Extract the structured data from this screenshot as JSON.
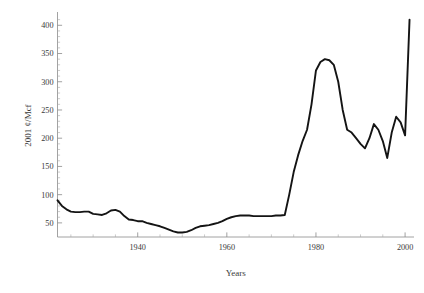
{
  "chart_data": {
    "type": "line",
    "title": "",
    "xlabel": "Years",
    "ylabel": "2001 ¢/Mcf",
    "xlim": [
      1922,
      2002
    ],
    "ylim": [
      25,
      420
    ],
    "grid": false,
    "legend": "none",
    "x_ticks_major": [
      1940,
      1960,
      1980,
      2000
    ],
    "x_tick_labels": [
      "1940",
      "1960",
      "1980",
      "2000"
    ],
    "x_ticks_minor": [
      1925,
      1930,
      1935,
      1945,
      1950,
      1955,
      1965,
      1970,
      1975,
      1985,
      1990,
      1995
    ],
    "y_ticks_major": [
      50,
      100,
      150,
      200,
      250,
      300,
      350,
      400
    ],
    "y_tick_labels": [
      "50",
      "100",
      "150",
      "200",
      "250",
      "300",
      "350",
      "400"
    ],
    "y_ticks_minor": [
      60,
      70,
      80,
      90,
      110,
      120,
      130,
      140,
      160,
      170,
      180,
      190,
      210,
      220,
      230,
      240,
      260,
      270,
      280,
      290,
      310,
      320,
      330,
      340,
      360,
      370,
      380,
      390,
      410
    ],
    "series": [
      {
        "name": "Wellhead price",
        "color": "#141414",
        "x": [
          1922,
          1923,
          1924,
          1925,
          1926,
          1927,
          1928,
          1929,
          1930,
          1931,
          1932,
          1933,
          1934,
          1935,
          1936,
          1937,
          1938,
          1939,
          1940,
          1941,
          1942,
          1943,
          1944,
          1945,
          1946,
          1947,
          1948,
          1949,
          1950,
          1951,
          1952,
          1953,
          1954,
          1955,
          1956,
          1957,
          1958,
          1959,
          1960,
          1961,
          1962,
          1963,
          1964,
          1965,
          1966,
          1967,
          1968,
          1969,
          1970,
          1971,
          1972,
          1973,
          1974,
          1975,
          1976,
          1977,
          1978,
          1979,
          1980,
          1981,
          1982,
          1983,
          1984,
          1985,
          1986,
          1987,
          1988,
          1989,
          1990,
          1991,
          1992,
          1993,
          1994,
          1995,
          1996,
          1997,
          1998,
          1999,
          2000,
          2001
        ],
        "y": [
          90,
          80,
          74,
          70,
          69,
          69,
          70,
          70,
          66,
          65,
          64,
          67,
          72,
          73,
          70,
          62,
          56,
          55,
          53,
          53,
          50,
          48,
          46,
          44,
          41,
          38,
          35,
          33,
          33,
          34,
          37,
          41,
          44,
          45,
          46,
          48,
          50,
          53,
          57,
          60,
          62,
          63,
          63,
          63,
          62,
          62,
          62,
          62,
          62,
          63,
          63,
          64,
          100,
          140,
          170,
          195,
          215,
          260,
          320,
          335,
          340,
          338,
          330,
          300,
          250,
          215,
          210,
          200,
          190,
          182,
          200,
          225,
          215,
          195,
          165,
          210,
          238,
          228,
          205,
          410
        ]
      }
    ]
  },
  "axis_titles": {
    "x": "Years",
    "y": "2001 ¢/Mcf"
  }
}
